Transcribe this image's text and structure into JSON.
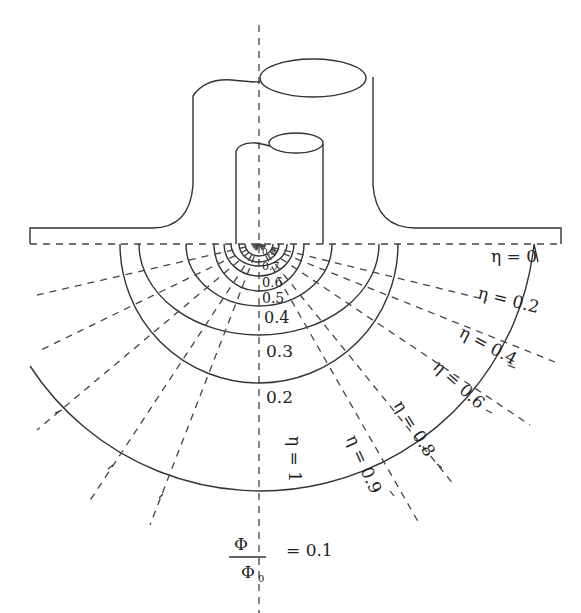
{
  "figure": {
    "potential_labels": [
      "0.8",
      "0.7",
      "0.6",
      "0.5",
      "0.4",
      "0.3",
      "0.2"
    ],
    "potential_ratio": {
      "numerator": "Φ",
      "denominator": "Φ",
      "denominator_subscript": "0",
      "value_text": "= 0.1"
    },
    "eta_labels": {
      "eta_0": "η = 0",
      "eta_02": "η = 0.2",
      "eta_04": "η = 0.4",
      "eta_06": "η = 0.6",
      "eta_08": "η = 0.8",
      "eta_09": "η = 0.9",
      "eta_1": "η = 1"
    },
    "colors": {
      "line": "#333333",
      "background": "#ffffff"
    }
  }
}
